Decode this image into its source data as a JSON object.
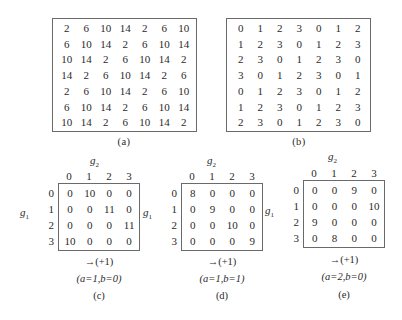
{
  "figure": {
    "panel_a": {
      "label": "(a)",
      "matrix": [
        [
          "2",
          "6",
          "10",
          "14",
          "2",
          "6",
          "10"
        ],
        [
          "6",
          "10",
          "14",
          "2",
          "6",
          "10",
          "14"
        ],
        [
          "10",
          "14",
          "2",
          "6",
          "10",
          "14",
          "2"
        ],
        [
          "14",
          "2",
          "6",
          "10",
          "14",
          "2",
          "6"
        ],
        [
          "2",
          "6",
          "10",
          "14",
          "2",
          "6",
          "10"
        ],
        [
          "6",
          "10",
          "14",
          "2",
          "6",
          "10",
          "14"
        ],
        [
          "10",
          "14",
          "2",
          "6",
          "10",
          "14",
          "2"
        ]
      ]
    },
    "panel_b": {
      "label": "(b)",
      "matrix": [
        [
          "0",
          "1",
          "2",
          "3",
          "0",
          "1",
          "2"
        ],
        [
          "1",
          "2",
          "3",
          "0",
          "1",
          "2",
          "3"
        ],
        [
          "2",
          "3",
          "0",
          "1",
          "2",
          "3",
          "0"
        ],
        [
          "3",
          "0",
          "1",
          "2",
          "3",
          "0",
          "1"
        ],
        [
          "0",
          "1",
          "2",
          "3",
          "0",
          "1",
          "2"
        ],
        [
          "1",
          "2",
          "3",
          "0",
          "1",
          "2",
          "3"
        ],
        [
          "2",
          "3",
          "0",
          "1",
          "2",
          "3",
          "0"
        ]
      ]
    },
    "panel_c": {
      "label": "(c)",
      "col_axis": "g",
      "col_axis_sub": "2",
      "row_axis": "g",
      "row_axis_sub": "1",
      "col_headers": [
        "0",
        "1",
        "2",
        "3"
      ],
      "row_headers": [
        "0",
        "1",
        "2",
        "3"
      ],
      "matrix": [
        [
          "0",
          "10",
          "0",
          "0"
        ],
        [
          "0",
          "0",
          "11",
          "0"
        ],
        [
          "0",
          "0",
          "0",
          "11"
        ],
        [
          "10",
          "0",
          "0",
          "0"
        ]
      ],
      "direction": "→(+1)",
      "params": "(a=1,b=0)"
    },
    "panel_d": {
      "label": "(d)",
      "col_axis": "g",
      "col_axis_sub": "2",
      "row_axis": "g",
      "row_axis_sub": "1",
      "col_headers": [
        "0",
        "1",
        "2",
        "3"
      ],
      "row_headers": [
        "0",
        "1",
        "2",
        "3"
      ],
      "matrix": [
        [
          "8",
          "0",
          "0",
          "0"
        ],
        [
          "0",
          "9",
          "0",
          "0"
        ],
        [
          "0",
          "0",
          "10",
          "0"
        ],
        [
          "0",
          "0",
          "0",
          "9"
        ]
      ],
      "direction": "→(+1)",
      "params": "(a=1,b=1)"
    },
    "panel_e": {
      "label": "(e)",
      "col_axis": "g",
      "col_axis_sub": "2",
      "row_axis": "g",
      "row_axis_sub": "1",
      "col_headers": [
        "0",
        "1",
        "2",
        "3"
      ],
      "row_headers": [
        "0",
        "1",
        "2",
        "3"
      ],
      "matrix": [
        [
          "0",
          "0",
          "9",
          "0"
        ],
        [
          "0",
          "0",
          "0",
          "10"
        ],
        [
          "9",
          "0",
          "0",
          "0"
        ],
        [
          "0",
          "8",
          "0",
          "0"
        ]
      ],
      "direction": "→(+1)",
      "params": "(a=2,b=0)"
    }
  }
}
